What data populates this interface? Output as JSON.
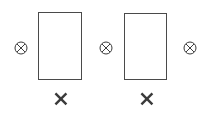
{
  "canvas": {
    "width": 207,
    "height": 134,
    "background_color": "#ffffff"
  },
  "palette": {
    "rect_stroke": "#4a4a4a",
    "circle_stroke": "#3c3c3c",
    "x_mark_color": "#3a3a3a",
    "background": "#ffffff"
  },
  "diagram": {
    "type": "schematic",
    "rectangles": [
      {
        "id": "rect-1",
        "icon_name": "rectangle-outline",
        "x": 38,
        "y": 12,
        "width": 44,
        "height": 68,
        "stroke_width": 1,
        "stroke_color": "#4a4a4a",
        "fill_color": "#ffffff"
      },
      {
        "id": "rect-2",
        "icon_name": "rectangle-outline",
        "x": 124,
        "y": 13,
        "width": 43,
        "height": 67,
        "stroke_width": 1,
        "stroke_color": "#4a4a4a",
        "fill_color": "#ffffff"
      }
    ],
    "circled_x_nodes": [
      {
        "id": "circled-x-left",
        "icon_name": "circled-x-icon",
        "glyph": "⊗",
        "center_x": 21,
        "center_y": 48,
        "radius": 6,
        "stroke_width": 1,
        "stroke_color": "#3c3c3c"
      },
      {
        "id": "circled-x-middle",
        "icon_name": "circled-x-icon",
        "glyph": "⊗",
        "center_x": 106,
        "center_y": 48,
        "radius": 6,
        "stroke_width": 1,
        "stroke_color": "#3c3c3c"
      },
      {
        "id": "circled-x-right",
        "icon_name": "circled-x-icon",
        "glyph": "⊗",
        "center_x": 190,
        "center_y": 48,
        "radius": 6,
        "stroke_width": 1,
        "stroke_color": "#3c3c3c"
      }
    ],
    "x_marks": [
      {
        "id": "x-mark-1",
        "icon_name": "x-mark-icon",
        "glyph": "✕",
        "center_x": 61,
        "center_y": 99,
        "size": 11,
        "stroke_width": 2.4,
        "color": "#3a3a3a"
      },
      {
        "id": "x-mark-2",
        "icon_name": "x-mark-icon",
        "glyph": "✕",
        "center_x": 147,
        "center_y": 99,
        "size": 11,
        "stroke_width": 2.4,
        "color": "#3a3a3a"
      }
    ]
  }
}
